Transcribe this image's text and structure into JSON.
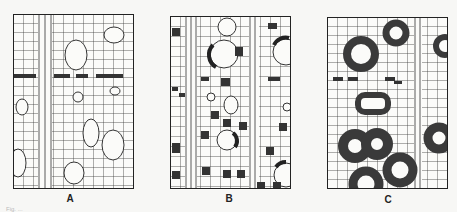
{
  "figure": {
    "panels": [
      {
        "id": "A",
        "label": "A",
        "description": "Wood cross-section grid with large open vessels and a row of dark dotted tangential cells"
      },
      {
        "id": "B",
        "label": "B",
        "description": "Wood cross-section grid with scattered dark cells and vessels partially ringed with dark tissue"
      },
      {
        "id": "C",
        "label": "C",
        "description": "Wood cross-section grid with vessels surrounded by thick dark-shaded rings"
      }
    ],
    "caption": "Fig. ..."
  }
}
